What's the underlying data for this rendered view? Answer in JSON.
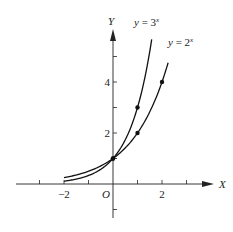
{
  "chart_data": {
    "type": "line",
    "title": "",
    "xlabel": "X",
    "ylabel": "Y",
    "origin_label": "O",
    "xlim": [
      -3,
      4
    ],
    "ylim": [
      -1.8,
      6
    ],
    "x_ticks": [
      -3,
      -2,
      -1,
      0,
      1,
      2,
      3
    ],
    "x_tick_labels": [
      {
        "value": -2,
        "label": "−2"
      },
      {
        "value": 2,
        "label": "2"
      }
    ],
    "y_ticks": [
      -1,
      1,
      2,
      3,
      4,
      5
    ],
    "y_tick_labels": [
      {
        "value": 2,
        "label": "2"
      },
      {
        "value": 4,
        "label": "4"
      }
    ],
    "grid": false,
    "series": [
      {
        "name": "y = 3^x",
        "label_base": "y = 3",
        "label_exp": "x",
        "function": "3^x",
        "x_range": [
          -2,
          1.58
        ],
        "marked_points": [
          [
            0,
            1
          ],
          [
            1,
            3
          ]
        ]
      },
      {
        "name": "y = 2^x",
        "label_base": "y = 2",
        "label_exp": "x",
        "function": "2^x",
        "x_range": [
          -2,
          2.25
        ],
        "marked_points": [
          [
            0,
            1
          ],
          [
            1,
            2
          ],
          [
            2,
            4
          ]
        ]
      }
    ]
  },
  "colors": {
    "axis": "#222222",
    "curve": "#111111",
    "background": "#ffffff"
  }
}
